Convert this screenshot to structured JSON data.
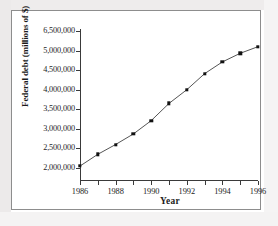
{
  "chart_data": {
    "type": "line",
    "title": "",
    "xlabel": "Year",
    "ylabel": "Federal debt (millions of $)",
    "x": [
      1986,
      1987,
      1988,
      1989,
      1990,
      1991,
      1992,
      1993,
      1994,
      1995,
      1996
    ],
    "values": [
      2050000,
      2350000,
      2600000,
      2870000,
      3210000,
      3650000,
      4000000,
      4410000,
      4710000,
      4930000,
      5100000
    ],
    "series": [
      {
        "name": "Federal debt",
        "values": [
          2050000,
          2350000,
          2600000,
          2870000,
          3210000,
          3650000,
          4000000,
          4410000,
          4710000,
          4930000,
          5100000
        ]
      }
    ],
    "xlim": [
      1986,
      1996
    ],
    "ylim": [
      2000000,
      6500000
    ],
    "ytick_labels": [
      "2,000,000",
      "2,500,000",
      "3,000,000",
      "3,500,000",
      "4,000,000",
      "4,500,000",
      "5,000,000",
      "6,500,000"
    ],
    "ytick_values": [
      2000000,
      2500000,
      3000000,
      3500000,
      4000000,
      4500000,
      5000000,
      6500000
    ],
    "xtick_labels": [
      "1986",
      "1988",
      "1990",
      "1992",
      "1994",
      "1996"
    ],
    "xtick_values": [
      1986,
      1988,
      1990,
      1992,
      1994,
      1996
    ],
    "xtick_minor_values": [
      1987,
      1989,
      1991,
      1993,
      1995
    ],
    "grid": false,
    "legend": false,
    "legend_position": "none",
    "marker": "filled-square",
    "line_color": "#555555",
    "marker_color": "#121212",
    "axis_color": "#3a3a3a",
    "background_color": "#ffffff"
  },
  "figure": {
    "frame_border_color": "#8d8d8d",
    "page_background": "#ffffff",
    "page_margin_tint": "#eceaea"
  }
}
